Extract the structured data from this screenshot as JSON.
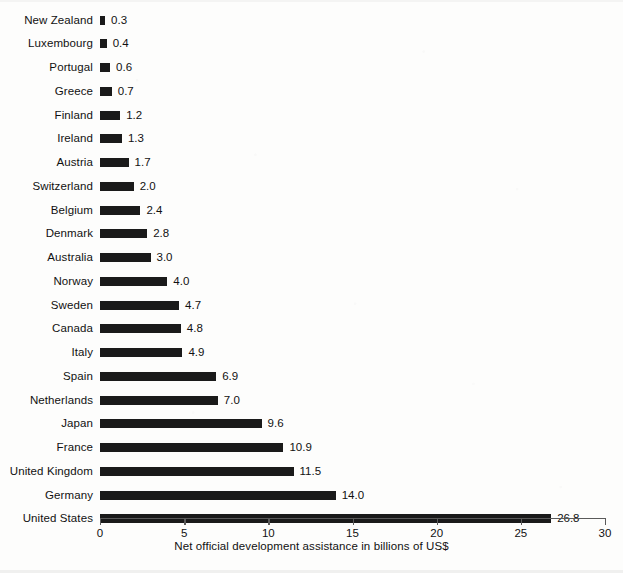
{
  "chart_data": {
    "type": "bar",
    "orientation": "horizontal",
    "title": "",
    "subtitle": "",
    "xlabel": "Net official development assistance in billions of US$",
    "ylabel": "",
    "xlim": [
      0,
      30
    ],
    "xticks": [
      0,
      5,
      10,
      15,
      20,
      25,
      30
    ],
    "xtick_labels": [
      "0",
      "5",
      "10",
      "15",
      "20",
      "25",
      "30"
    ],
    "grid": false,
    "legend": false,
    "legend_position": "none",
    "bar_color": "#1a1a1a",
    "background_color": "#fdfdfc",
    "axis_color": "#5a5a5a",
    "value_label_format": "one-decimal",
    "categories": [
      "New Zealand",
      "Luxembourg",
      "Portugal",
      "Greece",
      "Finland",
      "Ireland",
      "Austria",
      "Switzerland",
      "Belgium",
      "Denmark",
      "Australia",
      "Norway",
      "Sweden",
      "Canada",
      "Italy",
      "Spain",
      "Netherlands",
      "Japan",
      "France",
      "United Kingdom",
      "Germany",
      "United States"
    ],
    "values": [
      0.3,
      0.4,
      0.6,
      0.7,
      1.2,
      1.3,
      1.7,
      2.0,
      2.4,
      2.8,
      3.0,
      4.0,
      4.7,
      4.8,
      4.9,
      6.9,
      7.0,
      9.6,
      10.9,
      11.5,
      14.0,
      26.8
    ],
    "value_labels": [
      "0.3",
      "0.4",
      "0.6",
      "0.7",
      "1.2",
      "1.3",
      "1.7",
      "2.0",
      "2.4",
      "2.8",
      "3.0",
      "4.0",
      "4.7",
      "4.8",
      "4.9",
      "6.9",
      "7.0",
      "9.6",
      "10.9",
      "11.5",
      "14.0",
      "26.8"
    ]
  }
}
